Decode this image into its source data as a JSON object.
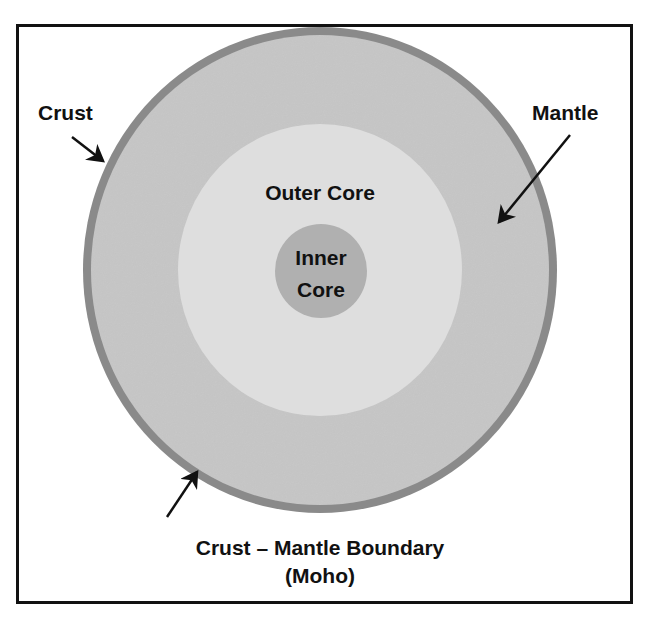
{
  "diagram": {
    "type": "earth-layers-cross-section",
    "colors": {
      "background": "#ffffff",
      "frame": "#111111",
      "crust": "#8a8a8a",
      "mantle": "#c6c6c6",
      "outer_core": "#dedede",
      "inner_core": "#b0b0b0",
      "text": "#111111"
    },
    "layers": [
      {
        "name": "Crust"
      },
      {
        "name": "Mantle"
      },
      {
        "name": "Outer Core"
      },
      {
        "name": "Inner Core"
      }
    ],
    "labels": {
      "crust": "Crust",
      "mantle": "Mantle",
      "outer_core": "Outer Core",
      "inner_core_line1": "Inner",
      "inner_core_line2": "Core",
      "moho_line1": "Crust – Mantle Boundary",
      "moho_line2": "(Moho)"
    }
  }
}
